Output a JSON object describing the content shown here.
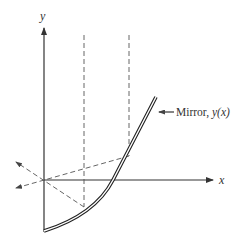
{
  "diagram": {
    "axes": {
      "x_label": "x",
      "y_label": "y"
    },
    "mirror": {
      "label_text": "Mirror, ",
      "label_func": "y(x)"
    },
    "colors": {
      "lines": "#333333",
      "dashed": "#555555",
      "background": "#ffffff"
    }
  }
}
